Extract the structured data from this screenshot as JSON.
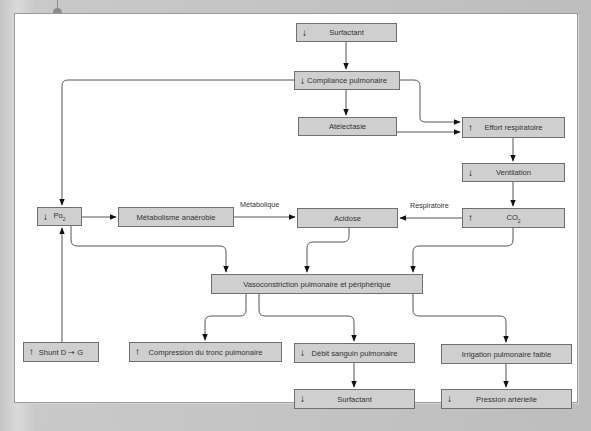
{
  "colors": {
    "node_fill": "#cfcfcf",
    "node_border": "#6f6f6f",
    "line": "#555555",
    "arrowhead": "#111111",
    "frame_bg": "#ffffff",
    "page_bg": "#c4c4c4"
  },
  "icons": {
    "down": "↓",
    "up": "↑",
    "right_arrow": "→"
  },
  "nodes": [
    {
      "id": "surfactant_top",
      "label": "Surfactant",
      "trend": "down",
      "x": 296,
      "y": 23,
      "w": 101,
      "h": 19
    },
    {
      "id": "compliance",
      "label": "Compliance pulmonaire",
      "trend": "down",
      "x": 294,
      "y": 71,
      "w": 106,
      "h": 19
    },
    {
      "id": "atelectasie",
      "label": "Atélectasie",
      "trend": "",
      "x": 298,
      "y": 117,
      "w": 99,
      "h": 19
    },
    {
      "id": "effort",
      "label": "Effort respiratoire",
      "trend": "up",
      "x": 462,
      "y": 117,
      "w": 103,
      "h": 21
    },
    {
      "id": "ventilation",
      "label": "Ventilation",
      "trend": "down",
      "x": 462,
      "y": 163,
      "w": 103,
      "h": 19
    },
    {
      "id": "po2",
      "label": "Po",
      "sub": "2",
      "trend": "down",
      "x": 37,
      "y": 207,
      "w": 45,
      "h": 19
    },
    {
      "id": "metabolisme",
      "label": "Métabolisme anaérobie",
      "trend": "",
      "x": 118,
      "y": 207,
      "w": 116,
      "h": 20
    },
    {
      "id": "acidose",
      "label": "Acidose",
      "trend": "",
      "x": 297,
      "y": 208,
      "w": 101,
      "h": 20
    },
    {
      "id": "co2",
      "label": "CO",
      "sub": "2",
      "trend": "up",
      "x": 462,
      "y": 208,
      "w": 103,
      "h": 20
    },
    {
      "id": "vasoconstriction",
      "label": "Vasoconstriction pulmonaire et périphérique",
      "trend": "",
      "x": 211,
      "y": 274,
      "w": 212,
      "h": 20
    },
    {
      "id": "shunt",
      "label": "Shunt D ➝ G",
      "trend": "up",
      "x": 23,
      "y": 342,
      "w": 76,
      "h": 20
    },
    {
      "id": "compression",
      "label": "Compression du tronc pulmonaire",
      "trend": "up",
      "x": 129,
      "y": 342,
      "w": 153,
      "h": 20
    },
    {
      "id": "debit",
      "label": "Débit sanguin pulmonaire",
      "trend": "down",
      "x": 294,
      "y": 343,
      "w": 121,
      "h": 20
    },
    {
      "id": "irrigation",
      "label": "Irrigation pulmonaire faible",
      "trend": "",
      "x": 441,
      "y": 344,
      "w": 131,
      "h": 20
    },
    {
      "id": "surfactant_bottom",
      "label": "Surfactant",
      "trend": "down",
      "x": 294,
      "y": 389,
      "w": 121,
      "h": 20
    },
    {
      "id": "pression",
      "label": "Pression artérielle",
      "trend": "down",
      "x": 441,
      "y": 389,
      "w": 131,
      "h": 20
    }
  ],
  "edge_labels": [
    {
      "id": "metabolique",
      "text": "Métabolique",
      "x": 240,
      "y": 200
    },
    {
      "id": "respiratoire",
      "text": "Respiratoire",
      "x": 410,
      "y": 201
    }
  ],
  "edges": [
    {
      "from": "surfactant_top",
      "to": "compliance",
      "d": "M346,42 L346,69"
    },
    {
      "from": "compliance",
      "to": "atelectasie",
      "d": "M346,90 L346,115"
    },
    {
      "from": "compliance",
      "to": "effort",
      "d": "M400,80 L414,80 Q420,80 420,86 L420,118 Q420,122 426,122 L460,122"
    },
    {
      "from": "atelectasie",
      "to": "effort",
      "d": "M397,132 L460,132"
    },
    {
      "from": "compliance",
      "to": "po2",
      "d": "M294,80 L68,80 Q62,80 62,86 L62,205"
    },
    {
      "from": "effort",
      "to": "ventilation",
      "d": "M513,138 L513,161"
    },
    {
      "from": "ventilation",
      "to": "co2",
      "d": "M513,182 L513,206"
    },
    {
      "from": "po2",
      "to": "metabolisme",
      "d": "M82,217 L116,217"
    },
    {
      "from": "metabolisme",
      "to": "acidose",
      "d": "M234,217 L295,217"
    },
    {
      "from": "co2",
      "to": "acidose",
      "d": "M462,218 L400,218"
    },
    {
      "from": "po2",
      "to": "vasoconstriction",
      "d": "M71,226 L71,240 Q71,246 77,246 L220,246 Q226,246 226,252 L226,272"
    },
    {
      "from": "acidose",
      "to": "vasoconstriction",
      "d": "M349,228 L349,236 Q349,242 343,242 L313,242 Q307,242 307,248 L307,272"
    },
    {
      "from": "co2",
      "to": "vasoconstriction",
      "d": "M513,228 L513,240 Q513,246 507,246 L419,246 Q413,246 413,252 L413,272"
    },
    {
      "from": "shunt",
      "to": "po2",
      "d": "M62,342 L62,228"
    },
    {
      "from": "vasoconstriction",
      "to": "compression",
      "d": "M246,294 L246,310 Q246,316 240,316 L211,316 Q205,316 205,322 L205,340"
    },
    {
      "from": "vasoconstriction",
      "to": "debit",
      "d": "M259,294 L259,310 Q259,316 265,316 L348,316 Q354,316 354,322 L354,341"
    },
    {
      "from": "vasoconstriction",
      "to": "irrigation",
      "d": "M413,294 L413,310 Q413,316 419,316 L500,316 Q506,316 506,322 L506,342"
    },
    {
      "from": "debit",
      "to": "surfactant_bottom",
      "d": "M354,363 L354,387"
    },
    {
      "from": "irrigation",
      "to": "pression",
      "d": "M506,364 L506,387"
    }
  ]
}
